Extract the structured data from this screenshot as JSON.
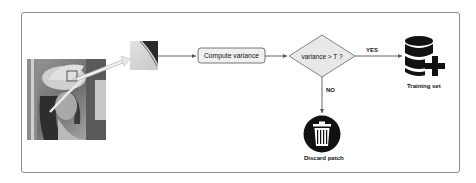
{
  "diagram": {
    "type": "flowchart",
    "nodes": {
      "input_image": {
        "label": "",
        "description": "grayscale portrait image with highlighted patch region"
      },
      "patch": {
        "label": "",
        "description": "zoomed image patch"
      },
      "process": {
        "label": "Compute variance"
      },
      "decision": {
        "label": "variance > T ?"
      },
      "yes_output": {
        "label": "Training set",
        "icon": "database-plus-icon"
      },
      "no_output": {
        "label": "Discard patch",
        "icon": "trash-icon"
      }
    },
    "edges": [
      {
        "from": "input_image",
        "to": "patch",
        "label": ""
      },
      {
        "from": "patch",
        "to": "process",
        "label": ""
      },
      {
        "from": "process",
        "to": "decision",
        "label": ""
      },
      {
        "from": "decision",
        "to": "yes_output",
        "label": "YES"
      },
      {
        "from": "decision",
        "to": "no_output",
        "label": "NO"
      }
    ]
  },
  "colors": {
    "frame_border": "#8a8a8a",
    "process_fill": "#f0f0f0",
    "decision_fill": "#e8e8e8",
    "stroke": "#555555",
    "icon_dark": "#111111"
  }
}
